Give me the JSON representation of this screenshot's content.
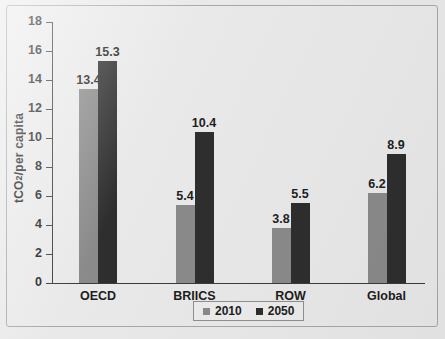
{
  "chart_data": {
    "type": "bar",
    "title": "",
    "xlabel": "",
    "ylabel": "tCO2/per capita",
    "ylabel_prefix": "tCO",
    "ylabel_sub": "2",
    "ylabel_suffix": "/per capita",
    "categories": [
      "OECD",
      "BRIICS",
      "ROW",
      "Global"
    ],
    "series": [
      {
        "name": "2010",
        "color": "#8a8a8a",
        "values": [
          13.4,
          5.4,
          3.8,
          6.2
        ]
      },
      {
        "name": "2050",
        "color": "#2e2e2e",
        "values": [
          15.3,
          10.4,
          5.5,
          8.9
        ]
      }
    ],
    "ylim": [
      0,
      18
    ],
    "yticks": [
      0,
      2,
      4,
      6,
      8,
      10,
      12,
      14,
      16,
      18
    ],
    "ytick_labels": [
      "0",
      "2",
      "4",
      "6",
      "8",
      "10",
      "12",
      "14",
      "16",
      "18"
    ],
    "grid": false,
    "legend_position": "bottom-center",
    "value_labels": [
      [
        "13.4",
        "5.4",
        "3.8",
        "6.2"
      ],
      [
        "15.3",
        "10.4",
        "5.5",
        "8.9"
      ]
    ]
  },
  "legend": {
    "items": [
      {
        "label": "2010",
        "color": "#8a8a8a"
      },
      {
        "label": "2050",
        "color": "#2e2e2e"
      }
    ]
  },
  "colors": {
    "background": "#e9e9e9",
    "frame": "#a8a8a8",
    "axis": "#3b3b3b",
    "text": "#1d1d1d",
    "series_2010": "#8a8a8a",
    "series_2050": "#2e2e2e"
  }
}
